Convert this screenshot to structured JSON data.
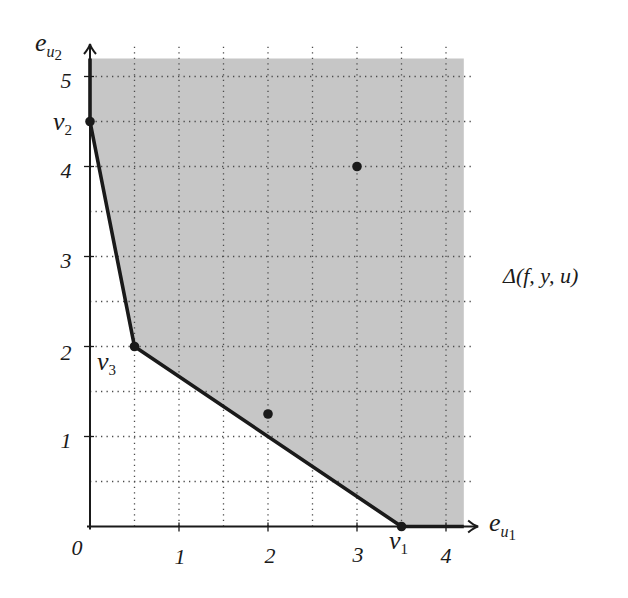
{
  "figure": {
    "region_label": "Δ(f, y, u)",
    "colors": {
      "region": "#c6c6c6",
      "line": "#1a1a1a",
      "grid": "#4a4a4a",
      "background": "#ffffff"
    },
    "axes": {
      "origin_label": "0",
      "x": {
        "label_base": "e",
        "label_sub": "u",
        "label_subsub": "1",
        "max": 4.35,
        "tick_values": [
          1,
          2,
          3,
          4
        ],
        "ticks": [
          "1",
          "2",
          "3",
          "4"
        ]
      },
      "y": {
        "label_base": "e",
        "label_sub": "u",
        "label_subsub": "2",
        "max": 5.35,
        "tick_values": [
          1,
          2,
          3,
          4,
          5
        ],
        "ticks": [
          "1",
          "2",
          "3",
          "4",
          "5"
        ]
      }
    },
    "grid": {
      "step": 0.5,
      "x_extent": 4.3,
      "y_extent": 5.37
    },
    "region_bounds": {
      "x_max": 4.2,
      "y_max": 5.2
    },
    "boundary": [
      [
        0,
        5.2
      ],
      [
        0,
        4.5
      ],
      [
        0.5,
        2
      ],
      [
        3.5,
        0
      ],
      [
        4.2,
        0
      ]
    ],
    "vertices": [
      {
        "base": "v",
        "sub": "1",
        "x": 3.5,
        "y": 0
      },
      {
        "base": "v",
        "sub": "2",
        "x": 0,
        "y": 4.5
      },
      {
        "base": "v",
        "sub": "3",
        "x": 0.5,
        "y": 2
      }
    ],
    "points": [
      {
        "x": 3,
        "y": 4
      },
      {
        "x": 2,
        "y": 1.25
      }
    ]
  }
}
